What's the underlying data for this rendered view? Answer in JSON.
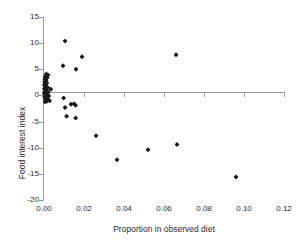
{
  "chart_data": {
    "type": "scatter",
    "title": "",
    "xlabel": "Proportion in observed diet",
    "ylabel": "Food interest index",
    "xlim": [
      0.0,
      0.12
    ],
    "ylim": [
      -20,
      15
    ],
    "xticks": [
      "0.00",
      "0.02",
      "0.04",
      "0.06",
      "0.08",
      "0.10",
      "0.12"
    ],
    "xtick_values": [
      0.0,
      0.02,
      0.04,
      0.06,
      0.08,
      0.1,
      0.12
    ],
    "yticks": [
      "15",
      "10",
      "5",
      "0",
      "-5",
      "-10",
      "-15",
      "-20"
    ],
    "ytick_values": [
      15,
      10,
      5,
      0,
      -5,
      -10,
      -15,
      -20
    ],
    "grid": false,
    "legend": null,
    "marker": "diamond",
    "marker_color": "#1a1a1a",
    "zero_reference_line": true,
    "points": [
      {
        "x": 0.0105,
        "y": 10.4
      },
      {
        "x": 0.019,
        "y": 7.4
      },
      {
        "x": 0.066,
        "y": 7.8
      },
      {
        "x": 0.0095,
        "y": 5.7
      },
      {
        "x": 0.016,
        "y": 5.0
      },
      {
        "x": 0.0012,
        "y": 4.1
      },
      {
        "x": 0.002,
        "y": 3.9
      },
      {
        "x": 0.0006,
        "y": 3.6
      },
      {
        "x": 0.0016,
        "y": 3.4
      },
      {
        "x": 0.0004,
        "y": 3.1
      },
      {
        "x": 0.001,
        "y": 2.9
      },
      {
        "x": 0.0003,
        "y": 2.6
      },
      {
        "x": 0.0014,
        "y": 2.4
      },
      {
        "x": 0.0007,
        "y": 2.2
      },
      {
        "x": 0.0002,
        "y": 2.0
      },
      {
        "x": 0.0011,
        "y": 1.8
      },
      {
        "x": 0.0005,
        "y": 1.6
      },
      {
        "x": 0.0018,
        "y": 1.5
      },
      {
        "x": 0.0034,
        "y": 1.2
      },
      {
        "x": 0.0002,
        "y": 1.3
      },
      {
        "x": 0.0009,
        "y": 1.1
      },
      {
        "x": 0.0015,
        "y": 0.9
      },
      {
        "x": 0.0004,
        "y": 0.8
      },
      {
        "x": 0.0021,
        "y": 0.6
      },
      {
        "x": 0.0008,
        "y": 0.5
      },
      {
        "x": 0.0001,
        "y": 0.4
      },
      {
        "x": 0.0013,
        "y": 0.2
      },
      {
        "x": 0.0006,
        "y": 0.1
      },
      {
        "x": 0.0024,
        "y": -0.1
      },
      {
        "x": 0.0003,
        "y": -0.3
      },
      {
        "x": 0.0011,
        "y": -0.5
      },
      {
        "x": 0.0018,
        "y": -0.7
      },
      {
        "x": 0.0007,
        "y": -0.8
      },
      {
        "x": 0.0028,
        "y": -1.0
      },
      {
        "x": 0.0014,
        "y": -1.1
      },
      {
        "x": 0.0005,
        "y": -1.2
      },
      {
        "x": 0.0098,
        "y": -0.5
      },
      {
        "x": 0.0105,
        "y": -2.3
      },
      {
        "x": 0.0135,
        "y": -1.7
      },
      {
        "x": 0.015,
        "y": -1.6
      },
      {
        "x": 0.0158,
        "y": -1.9
      },
      {
        "x": 0.0113,
        "y": -4.0
      },
      {
        "x": 0.0158,
        "y": -4.3
      },
      {
        "x": 0.026,
        "y": -7.7
      },
      {
        "x": 0.0365,
        "y": -12.3
      },
      {
        "x": 0.052,
        "y": -10.4
      },
      {
        "x": 0.0665,
        "y": -9.4
      },
      {
        "x": 0.096,
        "y": -15.6
      }
    ]
  }
}
